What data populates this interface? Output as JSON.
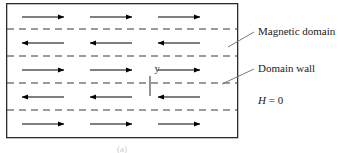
{
  "figure": {
    "type": "magnetic-domain-schematic",
    "caption": "(a)",
    "frame": {
      "x": 6,
      "y": 3,
      "width": 231,
      "height": 134,
      "stroke_color": "#2b2b2b",
      "stroke_width": 1.3,
      "fill": "#ffffff"
    }
  },
  "domain_walls": {
    "count": 4,
    "style": "dashed",
    "color": "#3a3a3a",
    "dash_pattern": "7 5",
    "y_positions": [
      29,
      56,
      83,
      110
    ]
  },
  "domains": {
    "count": 5,
    "rows": [
      {
        "index": 0,
        "direction": "right",
        "center_y": 17,
        "arrow_count": 3
      },
      {
        "index": 1,
        "direction": "left",
        "center_y": 43,
        "arrow_count": 3
      },
      {
        "index": 2,
        "direction": "right",
        "center_y": 70,
        "arrow_count": 3
      },
      {
        "index": 3,
        "direction": "left",
        "center_y": 97,
        "arrow_count": 3
      },
      {
        "index": 4,
        "direction": "right",
        "center_y": 124,
        "arrow_count": 3
      }
    ],
    "arrow_columns_x": [
      22,
      90,
      158
    ],
    "arrow_length": 42,
    "arrow_color": "#000000"
  },
  "axis_marker": {
    "label": "y",
    "label_x": 157,
    "label_y": 72,
    "tick_x": 150,
    "tick_y1": 76,
    "tick_y2": 96,
    "color": "#3a3a3a"
  },
  "annotations": [
    {
      "id": "magnetic-domain",
      "label": "Magnetic domain",
      "text_x": 258,
      "text_y": 35,
      "leader": {
        "x1": 228,
        "y1": 47,
        "x2": 254,
        "y2": 32
      }
    },
    {
      "id": "domain-wall",
      "label": "Domain wall",
      "text_x": 258,
      "text_y": 72,
      "leader": {
        "x1": 222,
        "y1": 84,
        "x2": 254,
        "y2": 69
      }
    }
  ],
  "field_label": {
    "symbol": "H",
    "relation": " = 0",
    "full": "H = 0",
    "x": 258,
    "y": 104
  },
  "colors": {
    "frame_stroke": "#2b2b2b",
    "wall_dash": "#3a3a3a",
    "arrow": "#000000",
    "text": "#1a1a1a",
    "leader": "#6b6b6b",
    "caption": "#c9c9c9",
    "background": "#ffffff"
  }
}
